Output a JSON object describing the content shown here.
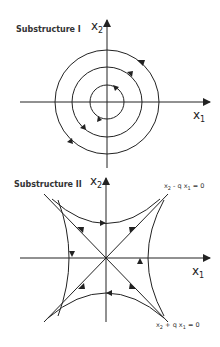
{
  "diagrams": [
    {
      "title": "Substructure I",
      "type": "phase-portrait-center",
      "x_axis": {
        "var": "x",
        "sub": "1"
      },
      "y_axis": {
        "var": "x",
        "sub": "2"
      },
      "orbits": "concentric circles, clockwise",
      "circle_count": 3
    },
    {
      "title": "Substructure II",
      "type": "phase-portrait-saddle",
      "x_axis": {
        "var": "x",
        "sub": "1"
      },
      "y_axis": {
        "var": "x",
        "sub": "2"
      },
      "eq_top": {
        "a": "x",
        "a_sub": "2",
        "op": " - q ",
        "b": "x",
        "b_sub": "1",
        "rhs": " = 0"
      },
      "eq_bottom": {
        "a": "x",
        "a_sub": "2",
        "op": " + q ",
        "b": "x",
        "b_sub": "1",
        "rhs": " = 0"
      }
    }
  ],
  "colors": {
    "line": "#222222",
    "text": "#333333",
    "background": "#ffffff"
  }
}
